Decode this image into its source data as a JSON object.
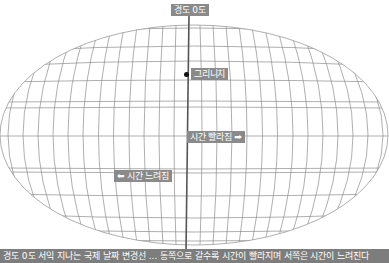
{
  "diagram": {
    "type": "world-graticule-projection",
    "labels": {
      "meridian_top": "경도 0도",
      "greenwich": "그리니치",
      "time_faster": "시간 빨라짐 ➡",
      "time_slower": "⬅ 시간 느려짐"
    },
    "caption": "경도 0도 서익 지나는 국제 날짜 변경선 ... 동쪽으로 갈수록 시간이 빨라지며 서쪽은 시간이 느려진다"
  },
  "colors": {
    "grid_line": "#8c8c8c",
    "meridian": "#555555",
    "label_bg": "#8a8a8a",
    "caption_bg": "#7d7d7d",
    "dot": "#111111"
  }
}
